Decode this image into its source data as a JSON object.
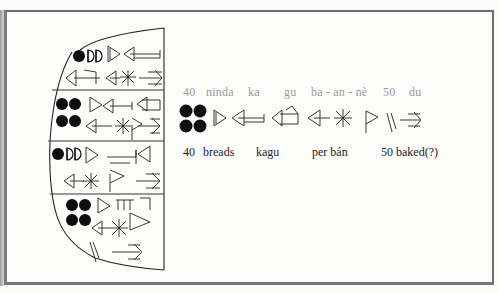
{
  "figure": {
    "tablet": {
      "registers": [
        {
          "numeral": "40",
          "numeral_signs": [
            "disc",
            "half",
            "half"
          ],
          "lines": 2
        },
        {
          "numeral": "40",
          "numeral_signs": [
            "disc",
            "disc",
            "disc",
            "disc"
          ],
          "lines": 2
        },
        {
          "numeral": "40",
          "numeral_signs": [
            "disc",
            "half",
            "half"
          ],
          "lines": 2
        },
        {
          "numeral": "40",
          "numeral_signs": [
            "disc",
            "disc",
            "disc",
            "disc"
          ],
          "lines": 3
        }
      ]
    },
    "transliteration": {
      "t40": "40",
      "ninda": "ninda",
      "ka": "ka",
      "gu": "gu",
      "ba_an_ne": "ba - an - nè",
      "t50": "50",
      "du": "du"
    },
    "translation": {
      "t40": "40",
      "breads": "breads",
      "kagu": "kagu",
      "per_ban": "per bán",
      "baked": "50 baked(?)"
    },
    "colors": {
      "frame": "#6d6d6d",
      "ink": "#111111",
      "translit": "#9a9a9a",
      "translation": "#222222"
    }
  }
}
